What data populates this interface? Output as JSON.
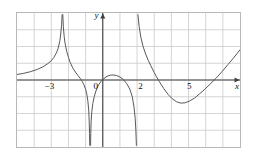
{
  "figure": {
    "kind": "cartesian-graph",
    "background": "#ffffff",
    "border_color": "#b8b8b8",
    "grid_color": "#c9c9c9",
    "axis_color": "#404040",
    "curve_color": "#555555"
  },
  "axes": {
    "x_label": "x",
    "y_label": "y",
    "x_tick_labels": [
      "-3",
      "0",
      "2",
      "5"
    ],
    "x_tick_values": [
      -3,
      0,
      2,
      5
    ],
    "x_label_display": [
      "−3",
      "0",
      "2",
      "5"
    ],
    "origin_label": "0"
  },
  "chart_data": {
    "type": "line",
    "title": "",
    "xlabel": "x",
    "ylabel": "y",
    "xlim": [
      -5,
      8
    ],
    "ylim": [
      -4,
      4
    ],
    "grid": true,
    "legend": null,
    "x_ticks": [
      -3,
      0,
      2,
      5
    ],
    "y_ticks": [],
    "asymptotes": {
      "vertical": [
        -2.35,
        2.0
      ],
      "note": "curve breaks at these x values"
    },
    "series": [
      {
        "name": "left-branch",
        "comment": "rises from left edge toward +infinity at x=-2.35",
        "points": [
          [
            -5.0,
            0.33
          ],
          [
            -4.6,
            0.4
          ],
          [
            -4.2,
            0.5
          ],
          [
            -3.8,
            0.64
          ],
          [
            -3.5,
            0.78
          ],
          [
            -3.2,
            0.98
          ],
          [
            -3.0,
            1.15
          ],
          [
            -2.85,
            1.35
          ],
          [
            -2.7,
            1.62
          ],
          [
            -2.6,
            1.9
          ],
          [
            -2.5,
            2.35
          ],
          [
            -2.45,
            2.75
          ],
          [
            -2.4,
            3.3
          ],
          [
            -2.37,
            3.9
          ]
        ]
      },
      {
        "name": "middle-left-branch",
        "comment": "drops from +infinity at x=-2.35 through zero near x=-1.9 down to -infinity near x=-0.75",
        "points": [
          [
            -2.33,
            3.9
          ],
          [
            -2.3,
            3.2
          ],
          [
            -2.25,
            2.6
          ],
          [
            -2.2,
            2.2
          ],
          [
            -2.1,
            1.7
          ],
          [
            -2.0,
            1.35
          ],
          [
            -1.9,
            1.05
          ],
          [
            -1.75,
            0.72
          ],
          [
            -1.6,
            0.48
          ],
          [
            -1.45,
            0.27
          ],
          [
            -1.3,
            0.08
          ],
          [
            -1.2,
            -0.08
          ],
          [
            -1.1,
            -0.28
          ],
          [
            -1.0,
            -0.55
          ],
          [
            -0.93,
            -0.85
          ],
          [
            -0.87,
            -1.25
          ],
          [
            -0.82,
            -1.8
          ],
          [
            -0.79,
            -2.5
          ],
          [
            -0.77,
            -3.2
          ],
          [
            -0.76,
            -3.9
          ]
        ]
      },
      {
        "name": "central-arch",
        "comment": "rises from -infinity near x=-0.72, peaks just above axis near x=0.6, falls to -infinity at x=2",
        "points": [
          [
            -0.71,
            -3.9
          ],
          [
            -0.7,
            -3.2
          ],
          [
            -0.68,
            -2.5
          ],
          [
            -0.64,
            -1.9
          ],
          [
            -0.58,
            -1.4
          ],
          [
            -0.5,
            -1.0
          ],
          [
            -0.38,
            -0.6
          ],
          [
            -0.25,
            -0.3
          ],
          [
            -0.1,
            -0.08
          ],
          [
            0.05,
            0.08
          ],
          [
            0.25,
            0.22
          ],
          [
            0.45,
            0.29
          ],
          [
            0.6,
            0.3
          ],
          [
            0.8,
            0.27
          ],
          [
            1.0,
            0.18
          ],
          [
            1.2,
            0.03
          ],
          [
            1.4,
            -0.22
          ],
          [
            1.58,
            -0.55
          ],
          [
            1.72,
            -1.0
          ],
          [
            1.82,
            -1.6
          ],
          [
            1.89,
            -2.3
          ],
          [
            1.93,
            -3.0
          ],
          [
            1.96,
            -3.9
          ]
        ]
      },
      {
        "name": "right-branch",
        "comment": "falls from +infinity at x=2, crosses axis near x=3.1, min about (4.4,-1.4), crosses axis near x=6.6, rises",
        "points": [
          [
            2.05,
            3.9
          ],
          [
            2.12,
            3.2
          ],
          [
            2.22,
            2.55
          ],
          [
            2.35,
            2.0
          ],
          [
            2.5,
            1.55
          ],
          [
            2.65,
            1.18
          ],
          [
            2.8,
            0.85
          ],
          [
            3.0,
            0.45
          ],
          [
            3.1,
            0.25
          ],
          [
            3.3,
            -0.1
          ],
          [
            3.55,
            -0.5
          ],
          [
            3.8,
            -0.85
          ],
          [
            4.05,
            -1.12
          ],
          [
            4.3,
            -1.3
          ],
          [
            4.55,
            -1.38
          ],
          [
            4.8,
            -1.36
          ],
          [
            5.05,
            -1.26
          ],
          [
            5.35,
            -1.08
          ],
          [
            5.65,
            -0.82
          ],
          [
            5.95,
            -0.55
          ],
          [
            6.25,
            -0.25
          ],
          [
            6.6,
            0.1
          ],
          [
            6.95,
            0.5
          ],
          [
            7.3,
            0.92
          ],
          [
            7.65,
            1.35
          ],
          [
            8.0,
            1.8
          ]
        ]
      }
    ]
  }
}
